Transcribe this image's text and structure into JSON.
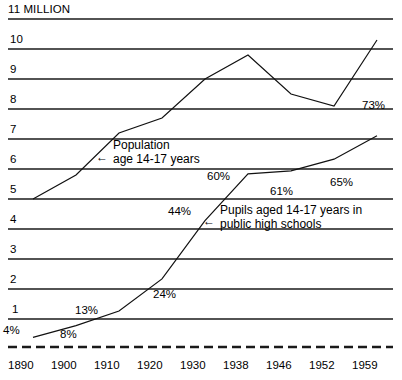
{
  "chart_data": {
    "type": "line",
    "title": "11 MILLION",
    "xlabel": "",
    "ylabel": "",
    "grid": true,
    "legend_position": "inline-annotations",
    "x": [
      1890,
      1900,
      1910,
      1920,
      1930,
      1938,
      1946,
      1952,
      1959
    ],
    "x_tick_labels": [
      "1890",
      "1900",
      "1910",
      "1920",
      "1930",
      "1938",
      "1946",
      "1952",
      "1959"
    ],
    "y_tick_labels": [
      "11 MILLION",
      "10",
      "9",
      "8",
      "7",
      "6",
      "5",
      "4",
      "3",
      "2",
      "1"
    ],
    "y_tick_values": [
      11,
      10,
      9,
      8,
      7,
      6,
      5,
      4,
      3,
      2,
      1
    ],
    "ylim": [
      0,
      11.4
    ],
    "series": [
      {
        "name": "Population age 14-17 years",
        "unit": "millions",
        "values": [
          5.0,
          5.8,
          7.2,
          7.7,
          9.0,
          9.8,
          8.5,
          8.1,
          10.3
        ]
      },
      {
        "name": "Pupils aged 14-17 years in public high schools",
        "unit": "percent",
        "values": [
          4,
          8,
          13,
          24,
          44,
          60,
          61,
          65,
          73
        ],
        "data_labels": [
          "4%",
          "8%",
          "13%",
          "24%",
          "44%",
          "60%",
          "61%",
          "65%",
          "73%"
        ]
      }
    ],
    "annotations": [
      {
        "id": "population-annotation",
        "text_line1": "Population",
        "text_line2": "age 14-17 years",
        "arrow": "←"
      },
      {
        "id": "pupils-annotation",
        "text_line1": "Pupils aged 14-17 years in",
        "text_line2": "public high schools",
        "arrow": "←"
      }
    ],
    "colors": {
      "line": "#111111",
      "grid": "#1a1a1a",
      "background": "#ffffff"
    }
  },
  "axis": {
    "y_labels": [
      "11 MILLION",
      "10",
      "9",
      "8",
      "7",
      "6",
      "5",
      "4",
      "3",
      "2",
      "1"
    ],
    "x_labels": [
      "1890",
      "1900",
      "1910",
      "1920",
      "1930",
      "1938",
      "1946",
      "1952",
      "1959"
    ]
  },
  "percent_labels": {
    "p1890": "4%",
    "p1900": "8%",
    "p1910": "13%",
    "p1920": "24%",
    "p1930": "44%",
    "p1938": "60%",
    "p1946": "61%",
    "p1952": "65%",
    "p1959": "73%"
  },
  "annotations": {
    "population": {
      "arrow": "←",
      "line1": "Population",
      "line2": "age 14-17 years"
    },
    "pupils": {
      "arrow": "←",
      "line1": "Pupils aged 14-17 years in",
      "line2": "public high schools"
    }
  }
}
